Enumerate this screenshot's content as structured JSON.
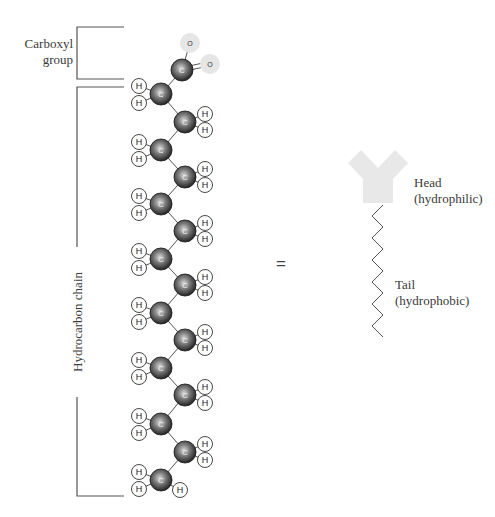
{
  "diagram": {
    "labels": {
      "carboxyl": [
        "Carboxyl",
        "group"
      ],
      "hydrocarbon": "Hydrocarbon chain",
      "equals": "=",
      "head": [
        "Head",
        "(hydrophilic)"
      ],
      "tail": [
        "Tail",
        "(hydrophobic)"
      ]
    },
    "atoms": {
      "carbon_symbol": "C",
      "hydrogen_symbol": "H",
      "oxygen_symbol": "O"
    },
    "colors": {
      "carbon_dark": "#2a2a2a",
      "carbon_light": "#bdbdbd",
      "hydrogen_fill": "#ffffff",
      "hydrogen_stroke": "#333333",
      "oxygen_fill": "#e6e6e6",
      "head_fill": "#e8e8e8",
      "bracket": "#555555",
      "bond": "#555555"
    },
    "carboxyl_group": {
      "carbon": {
        "x": 182,
        "y": 70
      },
      "oxygens": [
        {
          "x": 190,
          "y": 43,
          "bond": "single"
        },
        {
          "x": 210,
          "y": 64,
          "bond": "double"
        }
      ]
    },
    "chain_carbons": [
      {
        "x": 161,
        "y": 94,
        "side": "left"
      },
      {
        "x": 185,
        "y": 122,
        "side": "right"
      },
      {
        "x": 161,
        "y": 150,
        "side": "left"
      },
      {
        "x": 185,
        "y": 177,
        "side": "right"
      },
      {
        "x": 161,
        "y": 204,
        "side": "left"
      },
      {
        "x": 185,
        "y": 231,
        "side": "right"
      },
      {
        "x": 161,
        "y": 259,
        "side": "left"
      },
      {
        "x": 185,
        "y": 285,
        "side": "right"
      },
      {
        "x": 161,
        "y": 313,
        "side": "left"
      },
      {
        "x": 185,
        "y": 340,
        "side": "right"
      },
      {
        "x": 161,
        "y": 368,
        "side": "left"
      },
      {
        "x": 185,
        "y": 395,
        "side": "right"
      },
      {
        "x": 161,
        "y": 424,
        "side": "left"
      },
      {
        "x": 185,
        "y": 452,
        "side": "right"
      },
      {
        "x": 161,
        "y": 480,
        "side": "left",
        "terminal": true
      }
    ],
    "brackets": {
      "carboxyl": {
        "x": 77,
        "y1": 27,
        "y2": 79,
        "x_end": 124
      },
      "hydrocarbon_top": {
        "x": 77,
        "y1": 87,
        "y2": 247,
        "x_end": 124
      },
      "hydrocarbon_bottom": {
        "x": 77,
        "y1": 397,
        "y2": 496,
        "x_end": 124
      }
    },
    "head_shape": {
      "cx": 378,
      "top": 150,
      "bottom": 203
    },
    "tail": {
      "x_left": 372,
      "x_right": 383,
      "y_top": 205,
      "y_bottom": 337,
      "zigs": 12
    }
  }
}
